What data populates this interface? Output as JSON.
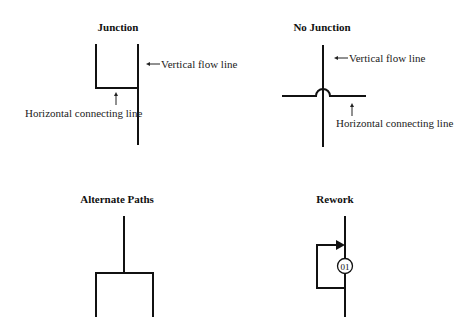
{
  "panels": {
    "junction": {
      "title": "Junction",
      "vertical_label": "Vertical flow line",
      "horizontal_label": "Horizontal connecting line"
    },
    "no_junction": {
      "title": "No Junction",
      "vertical_label": "Vertical flow line",
      "horizontal_label": "Horizontal connecting line"
    },
    "alternate_paths": {
      "title": "Alternate Paths"
    },
    "rework": {
      "title": "Rework",
      "node_label": "01"
    }
  },
  "colors": {
    "line": "#111111",
    "background": "#ffffff"
  }
}
